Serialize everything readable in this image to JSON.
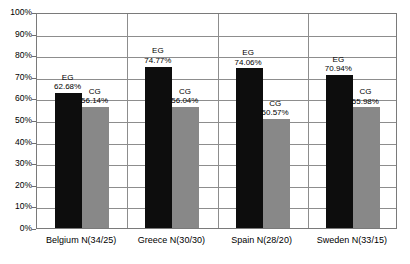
{
  "chart_data": {
    "type": "bar",
    "title": "",
    "subtitle": "",
    "xlabel": "",
    "ylabel": "",
    "ylim": [
      0,
      100
    ],
    "grid": true,
    "legend_position": "none",
    "categories": [
      "Belgium N(34/25)",
      "Greece N(30/30)",
      "Spain N(28/20)",
      "Sweden N(33/15)"
    ],
    "ytick_labels": [
      "100%",
      "90%",
      "80%",
      "70%",
      "60%",
      "50%",
      "40%",
      "30%",
      "20%",
      "10%",
      "0%"
    ],
    "ytick_values": [
      100,
      90,
      80,
      70,
      60,
      50,
      40,
      30,
      20,
      10,
      0
    ],
    "series": [
      {
        "name": "EG",
        "color": "#0d0d0d",
        "values": [
          62.68,
          74.77,
          74.06,
          70.94
        ],
        "labels": [
          "62.68%",
          "74.77%",
          "74.06%",
          "70.94%"
        ]
      },
      {
        "name": "CG",
        "color": "#888888",
        "values": [
          56.14,
          56.04,
          50.57,
          55.98
        ],
        "labels": [
          "56.14%",
          "56.04%",
          "50.57%",
          "55.98%"
        ]
      }
    ],
    "annotations": [
      {
        "category": "Belgium N(34/25)",
        "series": "EG",
        "text": "EG",
        "value_text": "62.68%"
      },
      {
        "category": "Belgium N(34/25)",
        "series": "CG",
        "text": "CG",
        "value_text": "56.14%"
      },
      {
        "category": "Greece N(30/30)",
        "series": "EG",
        "text": "EG",
        "value_text": "74.77%"
      },
      {
        "category": "Greece N(30/30)",
        "series": "CG",
        "text": "CG",
        "value_text": "56.04%"
      },
      {
        "category": "Spain N(28/20)",
        "series": "EG",
        "text": "EG",
        "value_text": "74.06%"
      },
      {
        "category": "Spain N(28/20)",
        "series": "CG",
        "text": "CG",
        "value_text": "50.57%"
      },
      {
        "category": "Sweden N(33/15)",
        "series": "EG",
        "text": "EG",
        "value_text": "70.94%"
      },
      {
        "category": "Sweden N(33/15)",
        "series": "CG",
        "text": "CG",
        "value_text": "55.98%"
      }
    ]
  },
  "colors": {
    "eg_bar": "#0d0d0d",
    "cg_bar": "#888888",
    "gridline": "#8d8d8d",
    "axis": "#7a7a7a",
    "background": "#ffffff",
    "text": "#000000"
  }
}
